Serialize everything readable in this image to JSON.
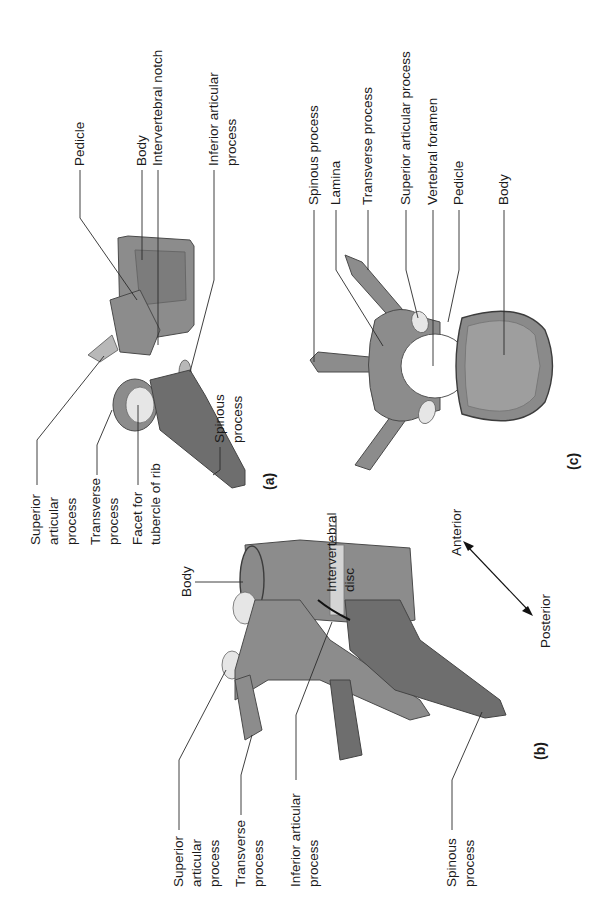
{
  "figure": {
    "orientation": "rotated 90 degrees counter-clockwise",
    "panels": [
      {
        "id": "a",
        "label": "(a)",
        "labels": [
          {
            "key": "superior_articular",
            "lines": [
              "Superior",
              "articular",
              "process"
            ]
          },
          {
            "key": "transverse",
            "lines": [
              "Transverse",
              "process"
            ]
          },
          {
            "key": "facet",
            "lines": [
              "Facet for",
              "tubercle of rib"
            ]
          },
          {
            "key": "pedicle",
            "lines": [
              "Pedicle"
            ]
          },
          {
            "key": "body",
            "lines": [
              "Body"
            ]
          },
          {
            "key": "notch",
            "lines": [
              "Intervertebral notch"
            ]
          },
          {
            "key": "inferior_articular",
            "lines": [
              "Inferior articular",
              "process"
            ]
          },
          {
            "key": "spinous",
            "lines": [
              "Spinous",
              "process"
            ]
          }
        ]
      },
      {
        "id": "b",
        "label": "(b)",
        "labels": [
          {
            "key": "body",
            "lines": [
              "Body"
            ]
          },
          {
            "key": "disc",
            "lines": [
              "Intervertebral",
              "disc"
            ]
          },
          {
            "key": "superior_articular",
            "lines": [
              "Superior",
              "articular",
              "process"
            ]
          },
          {
            "key": "transverse",
            "lines": [
              "Transverse",
              "process"
            ]
          },
          {
            "key": "inferior_articular",
            "lines": [
              "Inferior articular",
              "process"
            ]
          },
          {
            "key": "spinous",
            "lines": [
              "Spinous",
              "process"
            ]
          }
        ],
        "orientation_arrow": {
          "anterior": "Anterior",
          "posterior": "Posterior"
        }
      },
      {
        "id": "c",
        "label": "(c)",
        "labels": [
          {
            "key": "spinous",
            "lines": [
              "Spinous process"
            ]
          },
          {
            "key": "lamina",
            "lines": [
              "Lamina"
            ]
          },
          {
            "key": "transverse",
            "lines": [
              "Transverse process"
            ]
          },
          {
            "key": "superior_articular",
            "lines": [
              "Superior articular process"
            ]
          },
          {
            "key": "foramen",
            "lines": [
              "Vertebral foramen"
            ]
          },
          {
            "key": "pedicle",
            "lines": [
              "Pedicle"
            ]
          },
          {
            "key": "body",
            "lines": [
              "Body"
            ]
          }
        ]
      }
    ]
  }
}
